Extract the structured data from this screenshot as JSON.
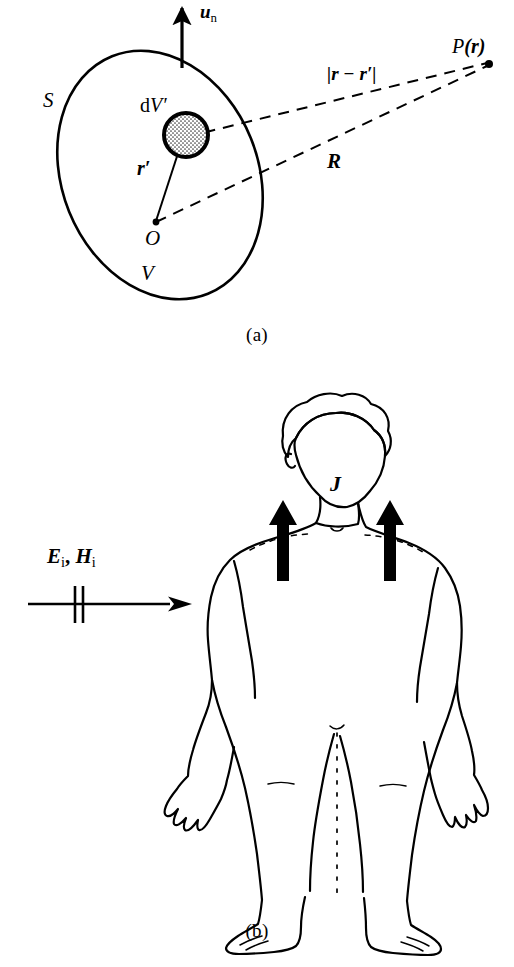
{
  "figure": {
    "panels": [
      {
        "id": "a",
        "caption": "(a)",
        "type": "volume-source-geometry-diagram",
        "labels": {
          "normal_vector": {
            "base": "u",
            "subscript": "n",
            "text": "u n"
          },
          "surface": "S",
          "volume": "V",
          "volume_element": {
            "prefix": "d",
            "base": "V",
            "prime": "′",
            "text": "dV′"
          },
          "source_position_vector": {
            "base": "r",
            "prime": "′",
            "text": "r′"
          },
          "origin": "O",
          "field_point": {
            "base": "P",
            "arg": "(r)",
            "text": "P (r)"
          },
          "separation_distance": "|r − r′|",
          "observation_distance": "R"
        }
      },
      {
        "id": "b",
        "caption": "(b)",
        "type": "human-body-induced-current-diagram",
        "labels": {
          "incident_fields": {
            "e_base": "E",
            "e_sub": "i",
            "comma": ",",
            "h_base": "H",
            "h_sub": "i",
            "text": "E i , H i"
          },
          "current_density": "J"
        }
      }
    ]
  },
  "colors": {
    "ink": "#000000",
    "background": "#ffffff",
    "stipple": "#4a4a4a"
  }
}
